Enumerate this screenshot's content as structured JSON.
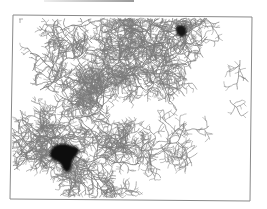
{
  "image": {
    "description": "Scanned figure of a branching fractal aggregate inside a rectangular frame",
    "frame": {
      "stroke": "#8a8a8a",
      "background": "#ffffff"
    },
    "clusters": [
      {
        "name": "large-cluster",
        "cx": 64,
        "cy": 156,
        "color": "#111111"
      },
      {
        "name": "small-cluster",
        "cx": 181,
        "cy": 31,
        "color": "#161616"
      }
    ],
    "filament_color": "#7a7a7a"
  }
}
